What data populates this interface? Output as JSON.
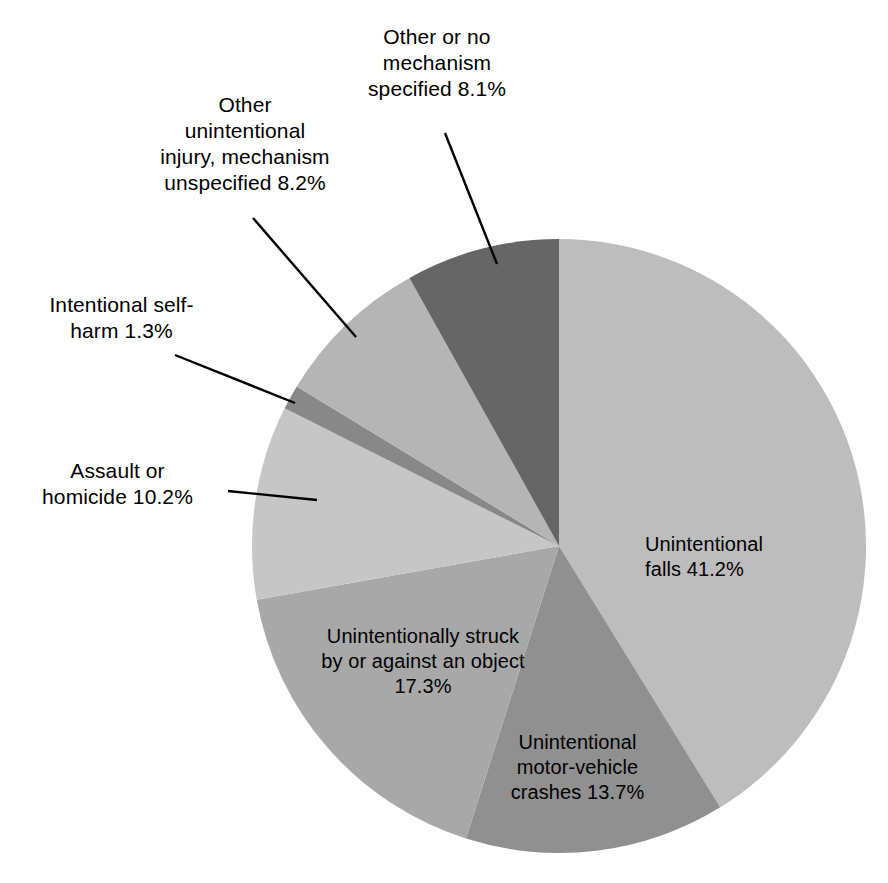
{
  "chart_data": {
    "type": "pie",
    "title": "",
    "subtitle": "",
    "xlabel": "",
    "ylabel": "",
    "legend_position": "none",
    "grid": false,
    "start_angle_deg": 0,
    "direction": "clockwise",
    "total_percent": 100.0,
    "categories": [
      "Unintentional falls",
      "Unintentional motor-vehicle crashes",
      "Unintentionally struck by or against an object",
      "Assault or homicide",
      "Intentional self-harm",
      "Other unintentional injury, mechanism unspecified",
      "Other or no mechanism specified"
    ],
    "values": [
      41.2,
      13.7,
      17.3,
      10.2,
      1.3,
      8.2,
      8.1
    ],
    "colors": [
      "#bdbdbd",
      "#909090",
      "#a8a8a8",
      "#c6c6c6",
      "#888888",
      "#b5b5b5",
      "#666666"
    ],
    "slices": [
      {
        "name": "unintentional-falls",
        "label": "Unintentional\nfalls 41.2%",
        "value": 41.2,
        "value_text": "41.2%",
        "color": "#bdbdbd",
        "label_placement": "inside"
      },
      {
        "name": "unintentional-motor-vehicle-crashes",
        "label": "Unintentional\nmotor-vehicle\ncrashes 13.7%",
        "value": 13.7,
        "value_text": "13.7%",
        "color": "#909090",
        "label_placement": "inside"
      },
      {
        "name": "unintentionally-struck-by-or-against-object",
        "label": "Unintentionally struck\nby or against an object\n17.3%",
        "value": 17.3,
        "value_text": "17.3%",
        "color": "#a8a8a8",
        "label_placement": "inside"
      },
      {
        "name": "assault-or-homicide",
        "label": "Assault or\nhomicide 10.2%",
        "value": 10.2,
        "value_text": "10.2%",
        "color": "#c6c6c6",
        "label_placement": "outside"
      },
      {
        "name": "intentional-self-harm",
        "label": "Intentional self-\nharm 1.3%",
        "value": 1.3,
        "value_text": "1.3%",
        "color": "#888888",
        "label_placement": "outside"
      },
      {
        "name": "other-unintentional-injury-mechanism-unspecified",
        "label": "Other\nunintentional\ninjury, mechanism\nunspecified 8.2%",
        "value": 8.2,
        "value_text": "8.2%",
        "color": "#b5b5b5",
        "label_placement": "outside"
      },
      {
        "name": "other-or-no-mechanism-specified",
        "label": "Other or no\nmechanism\nspecified 8.1%",
        "value": 8.1,
        "value_text": "8.1%",
        "color": "#666666",
        "label_placement": "outside"
      }
    ]
  },
  "labels": {
    "falls": "Unintentional\nfalls 41.2%",
    "motor_vehicle": "Unintentional\nmotor-vehicle\ncrashes 13.7%",
    "struck": "Unintentionally struck\nby or against an object\n17.3%",
    "assault": "Assault or\nhomicide 10.2%",
    "self_harm": "Intentional self-\nharm 1.3%",
    "other_unintentional": "Other\nunintentional\ninjury, mechanism\nunspecified 8.2%",
    "other_no_mechanism": "Other or no\nmechanism\nspecified 8.1%"
  },
  "style": {
    "background": "#ffffff",
    "leader_line_color": "#000000",
    "text_color": "#000000"
  }
}
